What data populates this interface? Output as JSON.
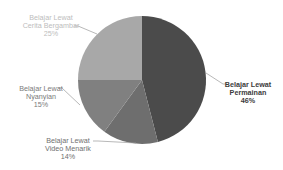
{
  "chart_data": {
    "type": "pie",
    "title": "",
    "categories": [
      "Belajar Lewat Permainan",
      "Belajar Lewat Video Menarik",
      "Belajar Lewat Nyanyian",
      "Belajar Lewat Cerita Bergambar"
    ],
    "values": [
      46,
      14,
      15,
      25
    ],
    "unit": "%",
    "colors": [
      "#4b4b4b",
      "#6e6e6e",
      "#808080",
      "#a8a8a8"
    ],
    "start_angle_deg": 0,
    "direction": "clockwise",
    "legend": "none (data labels with leader lines)"
  },
  "labels": {
    "permainan": {
      "line1": "Belajar Lewat",
      "line2": "Permainan",
      "pct": "46%"
    },
    "video": {
      "line1": "Belajar Lewat",
      "line2": "Video Menarik",
      "pct": "14%"
    },
    "nyanyian": {
      "line1": "Belajar Lewat",
      "line2": "Nyanyian",
      "pct": "15%"
    },
    "cerita": {
      "line1": "Belajar Lewat",
      "line2": "Cerita Bergambar",
      "pct": "25%"
    }
  }
}
